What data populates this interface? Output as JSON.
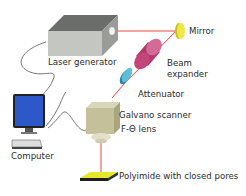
{
  "diagram": {
    "labels": {
      "laser_generator": "Laser generator",
      "mirror": "Mirror",
      "beam_expander_1": "Beam",
      "beam_expander_2": "expander",
      "attenuator": "Attenuator",
      "galvano_scanner": "Galvano scanner",
      "f_theta_lens": "F-Θ lens",
      "computer": "Computer",
      "sample": "Polyimide with closed pores"
    },
    "colors": {
      "laser_beam": "#e8463a",
      "mirror": "#e6e01e",
      "beam_expander": "#c7467a",
      "attenuator": "#3aa7c2",
      "laser_box": "#b9bbb6",
      "scanner": "#c8c49a",
      "monitor_screen": "#2d58c8",
      "sample": "#e6e82a"
    }
  }
}
